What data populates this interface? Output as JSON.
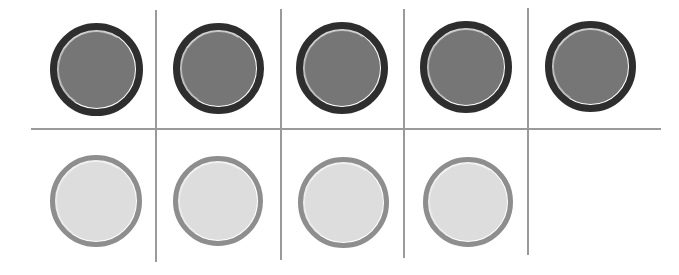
{
  "canvas": {
    "width": 679,
    "height": 275,
    "background": "#ffffff",
    "description": "Hand-drawn counting grid with two rows of round counters"
  },
  "palette": {
    "grid_line": "#9a9a9a",
    "dark_counter_rim": "#2e2e2e",
    "dark_counter_fill": "#767676",
    "dark_counter_highlight": "#cfcfcf",
    "light_counter_rim": "#8e8e8e",
    "light_counter_fill": "#dddddd",
    "light_counter_highlight": "#f3f3f3"
  },
  "grid": {
    "columns": 5,
    "rows": 2,
    "vertical_lines": [
      {
        "name": "column-divider-1",
        "x": 155,
        "y_top": 10,
        "y_bottom": 262
      },
      {
        "name": "column-divider-2",
        "x": 280,
        "y_top": 9,
        "y_bottom": 260
      },
      {
        "name": "column-divider-3",
        "x": 403,
        "y_top": 9,
        "y_bottom": 258
      },
      {
        "name": "column-divider-4",
        "x": 527,
        "y_top": 8,
        "y_bottom": 255
      }
    ],
    "horizontal_lines": [
      {
        "name": "row-divider-1",
        "y": 128,
        "x_left": 31,
        "x_right": 661
      }
    ]
  },
  "rows": [
    {
      "name": "top-row",
      "counter_style": "dark",
      "count": 5,
      "counters": [
        {
          "name": "dark-counter-1",
          "cx": 96,
          "cy": 69,
          "d": 93
        },
        {
          "name": "dark-counter-2",
          "cx": 218,
          "cy": 68,
          "d": 91
        },
        {
          "name": "dark-counter-3",
          "cx": 342,
          "cy": 68,
          "d": 92
        },
        {
          "name": "dark-counter-4",
          "cx": 466,
          "cy": 67,
          "d": 92
        },
        {
          "name": "dark-counter-5",
          "cx": 590,
          "cy": 66,
          "d": 91
        }
      ]
    },
    {
      "name": "bottom-row",
      "counter_style": "light",
      "count": 4,
      "counters": [
        {
          "name": "light-counter-1",
          "cx": 96,
          "cy": 201,
          "d": 92
        },
        {
          "name": "light-counter-2",
          "cx": 218,
          "cy": 201,
          "d": 90
        },
        {
          "name": "light-counter-3",
          "cx": 343,
          "cy": 202,
          "d": 91
        },
        {
          "name": "light-counter-4",
          "cx": 468,
          "cy": 202,
          "d": 90
        }
      ],
      "empty_cells": [
        {
          "name": "empty-cell-5",
          "column": 5
        }
      ]
    }
  ],
  "chart_data": {
    "type": "bar",
    "title": "",
    "xlabel": "",
    "ylabel": "",
    "categories": [
      "top-row",
      "bottom-row"
    ],
    "values": [
      5,
      4
    ],
    "grid": true,
    "legend": null,
    "annotations": [
      "Top row: 5 dark counters filling all 5 grid cells",
      "Bottom row: 4 light counters, rightmost grid cell empty"
    ]
  }
}
